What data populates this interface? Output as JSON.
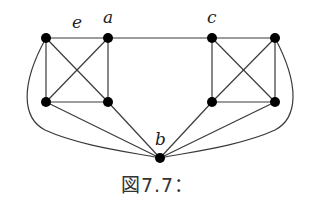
{
  "figure": {
    "caption": "図7.7：",
    "labels": {
      "e": "e",
      "a": "a",
      "c": "c",
      "b": "b"
    },
    "nodes": [
      {
        "id": "v1",
        "x": 46,
        "y": 38
      },
      {
        "id": "a",
        "x": 108,
        "y": 38
      },
      {
        "id": "v3",
        "x": 46,
        "y": 102
      },
      {
        "id": "v4",
        "x": 108,
        "y": 102
      },
      {
        "id": "c",
        "x": 212,
        "y": 38
      },
      {
        "id": "v6",
        "x": 275,
        "y": 38
      },
      {
        "id": "v7",
        "x": 212,
        "y": 102
      },
      {
        "id": "v8",
        "x": 275,
        "y": 102
      },
      {
        "id": "b",
        "x": 160,
        "y": 158
      }
    ],
    "edges": [
      [
        "v1",
        "a",
        "edge e"
      ],
      [
        "v1",
        "v3"
      ],
      [
        "a",
        "v4"
      ],
      [
        "v3",
        "v4"
      ],
      [
        "v1",
        "v4"
      ],
      [
        "a",
        "v3"
      ],
      [
        "a",
        "c"
      ],
      [
        "c",
        "v6"
      ],
      [
        "c",
        "v7"
      ],
      [
        "v6",
        "v8"
      ],
      [
        "v7",
        "v8"
      ],
      [
        "c",
        "v8"
      ],
      [
        "v6",
        "v7"
      ],
      [
        "v3",
        "b"
      ],
      [
        "v4",
        "b"
      ],
      [
        "v7",
        "b"
      ],
      [
        "v8",
        "b"
      ],
      [
        "v1",
        "b",
        "curved"
      ],
      [
        "v6",
        "b",
        "curved"
      ]
    ]
  }
}
